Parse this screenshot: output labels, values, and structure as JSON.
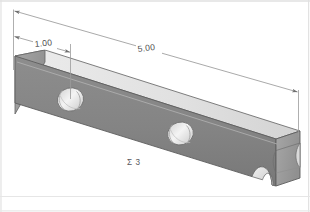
{
  "drawing": {
    "title": "isometric-bar-part-view",
    "background_color": "#ffffff",
    "border_color": "#e2e2e2",
    "part": {
      "name": "rectangular-bar",
      "front_face_color": "#878787",
      "front_face_color_dark": "#7b7b7b",
      "top_face_color": "#e3e3e3",
      "end_face_color": "#9c9c9c",
      "outline_color": "#5e5e5e",
      "hole_fill": "#f2f2f2",
      "hole_shadow": "#b4b4b4",
      "hole_count_through": 2,
      "notch_count": 1
    },
    "dimensions": [
      {
        "name": "hole-position-dimension",
        "value": "1.00",
        "label": "1.00",
        "target": "first-hole-center"
      },
      {
        "name": "overall-length-dimension",
        "value": "5.00",
        "label": "5.00",
        "target": "bar-overall-length"
      }
    ],
    "annotations": [
      {
        "name": "sheet-note",
        "text": "Σ 3"
      }
    ],
    "line_color": "#9a9a9a",
    "arrow_color": "#6e6e6e"
  }
}
